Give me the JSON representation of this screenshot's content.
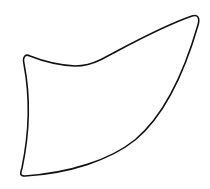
{
  "figure": {
    "stroke_color": "#111111",
    "background_color": "#ffffff",
    "stroke_width": 1.6
  }
}
